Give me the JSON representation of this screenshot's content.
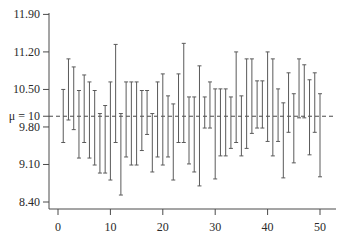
{
  "chart_data": {
    "type": "errorbar",
    "title": "",
    "xlabel": "",
    "ylabel": "",
    "reference_line": {
      "value": 10,
      "label": "μ = 10",
      "style": "dashed"
    },
    "x_ticks": [
      0,
      10,
      20,
      30,
      40,
      50
    ],
    "y_ticks": [
      {
        "value": 11.9,
        "label": "11.90"
      },
      {
        "value": 11.2,
        "label": "11.20"
      },
      {
        "value": 10.5,
        "label": "10.50"
      },
      {
        "value": 9.8,
        "label": "9.80"
      },
      {
        "value": 9.1,
        "label": "9.10"
      },
      {
        "value": 8.4,
        "label": "8.40"
      }
    ],
    "xlim": [
      -1.8,
      52.5
    ],
    "ylim": [
      8.28,
      11.94
    ],
    "grid": false,
    "intervals": [
      {
        "x": 1,
        "lower": 9.51,
        "upper": 10.5
      },
      {
        "x": 2,
        "lower": 9.93,
        "upper": 11.07
      },
      {
        "x": 3,
        "lower": 9.75,
        "upper": 10.92
      },
      {
        "x": 4,
        "lower": 9.22,
        "upper": 10.48
      },
      {
        "x": 5,
        "lower": 9.51,
        "upper": 10.77
      },
      {
        "x": 6,
        "lower": 9.22,
        "upper": 10.64
      },
      {
        "x": 7,
        "lower": 9.09,
        "upper": 10.48
      },
      {
        "x": 8,
        "lower": 8.94,
        "upper": 10.05
      },
      {
        "x": 9,
        "lower": 8.94,
        "upper": 10.2
      },
      {
        "x": 10,
        "lower": 8.81,
        "upper": 10.64
      },
      {
        "x": 11,
        "lower": 9.51,
        "upper": 11.34
      },
      {
        "x": 12,
        "lower": 8.53,
        "upper": 10.05
      },
      {
        "x": 13,
        "lower": 9.24,
        "upper": 10.64
      },
      {
        "x": 14,
        "lower": 9.09,
        "upper": 10.64
      },
      {
        "x": 15,
        "lower": 9.09,
        "upper": 10.64
      },
      {
        "x": 16,
        "lower": 9.36,
        "upper": 10.48
      },
      {
        "x": 17,
        "lower": 9.66,
        "upper": 10.48
      },
      {
        "x": 18,
        "lower": 8.96,
        "upper": 10.05
      },
      {
        "x": 19,
        "lower": 9.24,
        "upper": 10.64
      },
      {
        "x": 20,
        "lower": 9.09,
        "upper": 10.79
      },
      {
        "x": 21,
        "lower": 9.24,
        "upper": 10.38
      },
      {
        "x": 22,
        "lower": 8.81,
        "upper": 10.23
      },
      {
        "x": 23,
        "lower": 9.51,
        "upper": 10.79
      },
      {
        "x": 24,
        "lower": 9.51,
        "upper": 11.36
      },
      {
        "x": 25,
        "lower": 9.11,
        "upper": 10.36
      },
      {
        "x": 26,
        "lower": 8.96,
        "upper": 10.36
      },
      {
        "x": 27,
        "lower": 8.7,
        "upper": 10.94
      },
      {
        "x": 28,
        "lower": 9.78,
        "upper": 10.36
      },
      {
        "x": 29,
        "lower": 9.78,
        "upper": 10.64
      },
      {
        "x": 30,
        "lower": 8.83,
        "upper": 10.51
      },
      {
        "x": 31,
        "lower": 9.26,
        "upper": 10.51
      },
      {
        "x": 32,
        "lower": 9.26,
        "upper": 10.51
      },
      {
        "x": 33,
        "lower": 9.4,
        "upper": 10.36
      },
      {
        "x": 34,
        "lower": 9.51,
        "upper": 11.2
      },
      {
        "x": 35,
        "lower": 9.26,
        "upper": 10.38
      },
      {
        "x": 36,
        "lower": 9.4,
        "upper": 11.07
      },
      {
        "x": 37,
        "lower": 9.68,
        "upper": 11.07
      },
      {
        "x": 38,
        "lower": 9.78,
        "upper": 10.66
      },
      {
        "x": 39,
        "lower": 9.78,
        "upper": 10.66
      },
      {
        "x": 40,
        "lower": 9.53,
        "upper": 11.2
      },
      {
        "x": 41,
        "lower": 9.26,
        "upper": 11.07
      },
      {
        "x": 42,
        "lower": 9.53,
        "upper": 10.51
      },
      {
        "x": 43,
        "lower": 8.85,
        "upper": 10.25
      },
      {
        "x": 44,
        "lower": 9.7,
        "upper": 10.81
      },
      {
        "x": 45,
        "lower": 9.13,
        "upper": 10.42
      },
      {
        "x": 46,
        "lower": 9.97,
        "upper": 11.07
      },
      {
        "x": 47,
        "lower": 9.97,
        "upper": 10.96
      },
      {
        "x": 48,
        "lower": 9.28,
        "upper": 10.68
      },
      {
        "x": 49,
        "lower": 9.7,
        "upper": 10.81
      },
      {
        "x": 50,
        "lower": 8.87,
        "upper": 10.42
      }
    ]
  },
  "labels": {
    "mu_label": "μ = 10"
  }
}
